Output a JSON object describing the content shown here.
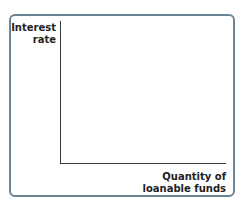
{
  "chart_data": {
    "type": "line",
    "title": "",
    "xlabel": "Quantity of loanable funds",
    "ylabel": "Interest rate",
    "series": [],
    "grid": false,
    "legend": null
  },
  "labels": {
    "y_line1": "Interest",
    "y_line2": "rate",
    "x_line1": "Quantity of",
    "x_line2": "loanable funds"
  }
}
